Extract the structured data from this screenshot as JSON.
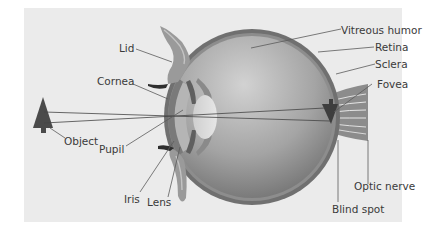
{
  "diagram": {
    "title": "",
    "colors": {
      "panel_bg": "#ebebeb",
      "sclera": "#6f6f6f",
      "retina": "#8a8a8a",
      "vitreous_light": "#c9c9c9",
      "vitreous_dark": "#6e6e6e",
      "lens": "#d6d6d6",
      "object": "#4a4a4a",
      "text": "#3a3a3a"
    },
    "labels": {
      "lid": "Lid",
      "cornea": "Cornea",
      "object": "Object",
      "pupil": "Pupil",
      "iris": "Iris",
      "lens": "Lens",
      "vitreous_humor": "Vitreous humor",
      "retina": "Retina",
      "sclera": "Sclera",
      "fovea": "Fovea",
      "optic_nerve": "Optic nerve",
      "blind_spot": "Blind spot"
    }
  }
}
